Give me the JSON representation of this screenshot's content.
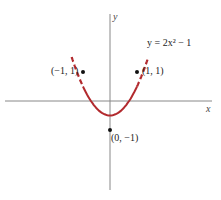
{
  "chart_data": {
    "type": "line",
    "title": "",
    "equation_label": "y = 2x² − 1",
    "xlabel": "x",
    "ylabel": "y",
    "series": [
      {
        "name": "y = 2x^2 - 1",
        "color": "#b22a2e",
        "solid_domain": [
          -1,
          1
        ],
        "dashed_domain": [
          -1.4,
          1.4
        ],
        "x": [
          -1.4,
          -1,
          -0.5,
          0,
          0.5,
          1,
          1.4
        ],
        "y": [
          2.92,
          1,
          -0.5,
          -1,
          -0.5,
          1,
          2.92
        ]
      }
    ],
    "points": [
      {
        "x": -1,
        "y": 1,
        "label": "(−1, 1)"
      },
      {
        "x": 1,
        "y": 1,
        "label": "(1, 1)"
      },
      {
        "x": 0,
        "y": -1,
        "label": "(0, −1)"
      }
    ],
    "grid": false
  }
}
